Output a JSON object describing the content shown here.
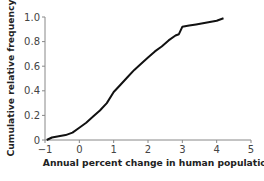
{
  "chart_data": {
    "type": "line",
    "title": "",
    "xlabel": "Annual percent change in human population",
    "ylabel": "Cumulative relative frequency",
    "xlim": [
      -1,
      5
    ],
    "ylim": [
      0,
      1.0
    ],
    "grid": false,
    "legend": null,
    "x_ticks": [
      "−1",
      "0",
      "1",
      "2",
      "3",
      "4",
      "5"
    ],
    "y_ticks": [
      "0",
      "0.2",
      "0.4",
      "0.6",
      "0.8",
      "1.0"
    ],
    "series": [
      {
        "name": "cumulative frequency",
        "color": "#111111",
        "x": [
          -0.95,
          -0.8,
          -0.6,
          -0.4,
          -0.2,
          0.0,
          0.2,
          0.4,
          0.6,
          0.8,
          1.0,
          1.2,
          1.4,
          1.6,
          1.8,
          2.0,
          2.2,
          2.4,
          2.6,
          2.8,
          2.9,
          3.0,
          3.2,
          3.4,
          3.6,
          3.8,
          4.0,
          4.2
        ],
        "values": [
          0.0,
          0.02,
          0.03,
          0.04,
          0.06,
          0.1,
          0.14,
          0.19,
          0.24,
          0.3,
          0.39,
          0.45,
          0.51,
          0.57,
          0.62,
          0.67,
          0.72,
          0.76,
          0.81,
          0.85,
          0.86,
          0.92,
          0.93,
          0.94,
          0.95,
          0.96,
          0.97,
          0.99
        ]
      }
    ]
  }
}
